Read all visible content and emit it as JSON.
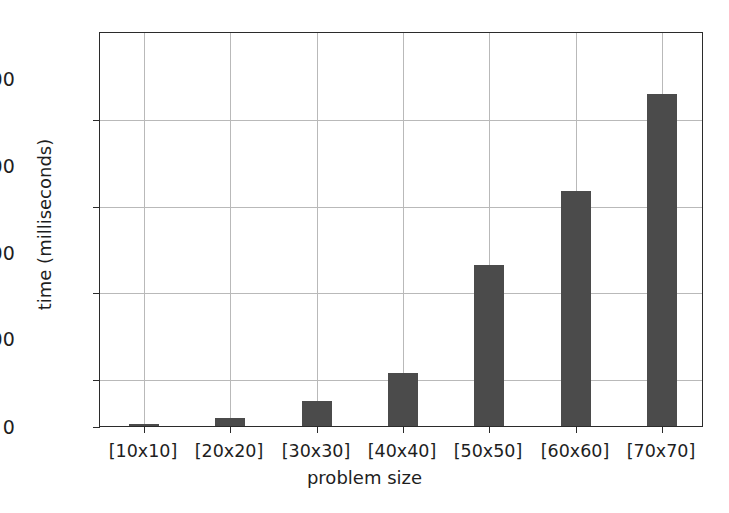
{
  "chart_data": {
    "type": "bar",
    "title": "",
    "xlabel": "problem size",
    "ylabel": "time (milliseconds)",
    "categories": [
      "[10x10]",
      "[20x20]",
      "[30x30]",
      "[40x40]",
      "[50x50]",
      "[60x60]",
      "[70x70]"
    ],
    "values": [
      5,
      21,
      65,
      137,
      420,
      612,
      865
    ],
    "ylim": [
      0,
      910
    ],
    "yticks": [
      0,
      200,
      400,
      600,
      800
    ],
    "ytick_labels": [
      "0",
      "200",
      "400",
      "600",
      "800"
    ],
    "grid": true,
    "legend": null,
    "bar_color": "#4b4b4b",
    "grid_color": "#b9b9b9",
    "axis_color": "#2b2b2b",
    "background": "#ffffff"
  }
}
